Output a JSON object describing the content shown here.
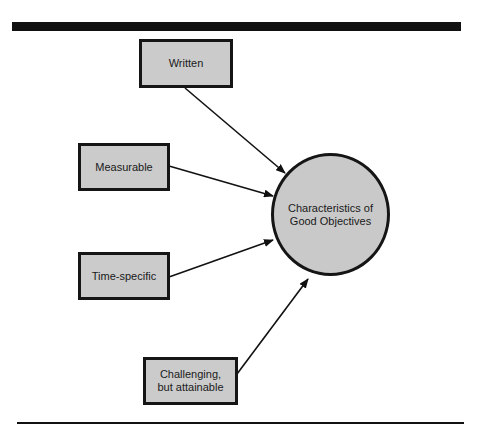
{
  "diagram": {
    "center": {
      "label": "Characteristics of\nGood Objectives",
      "fill": "#c9c9c9"
    },
    "nodes": [
      {
        "id": "written",
        "label": "Written"
      },
      {
        "id": "measurable",
        "label": "Measurable"
      },
      {
        "id": "time-specific",
        "label": "Time-specific"
      },
      {
        "id": "challenging",
        "label": "Challenging,\nbut attainable"
      }
    ],
    "edges": [
      {
        "from": "written",
        "to": "center"
      },
      {
        "from": "measurable",
        "to": "center"
      },
      {
        "from": "time-specific",
        "to": "center"
      },
      {
        "from": "challenging",
        "to": "center"
      }
    ],
    "colors": {
      "box_fill": "#cbcbcb",
      "stroke": "#151515",
      "background": "#ffffff"
    }
  }
}
